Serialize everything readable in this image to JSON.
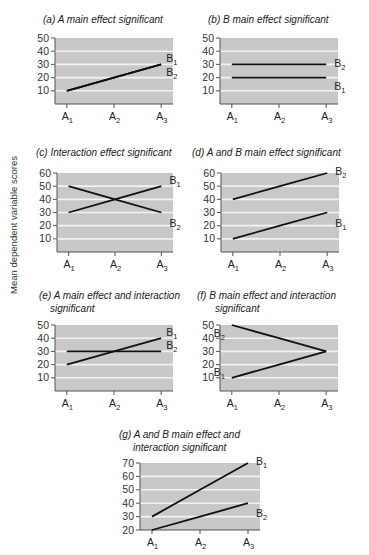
{
  "figure": {
    "shared_ylabel": "Mean dependent variable scores"
  },
  "chart_data": [
    {
      "id": "a",
      "type": "line",
      "title": "(a) A main effect significant",
      "xlabel": "",
      "ylabel": "Mean dependent variable scores",
      "categories": [
        "A1",
        "A2",
        "A3"
      ],
      "yticks": [
        10,
        20,
        30,
        40,
        50
      ],
      "ylim": [
        0,
        50
      ],
      "grid": true,
      "series": [
        {
          "name": "B1",
          "values": [
            10,
            20,
            30
          ]
        },
        {
          "name": "B2",
          "values": [
            10,
            20,
            30
          ]
        }
      ],
      "annotations": [
        "B1 and B2 lines coincide"
      ]
    },
    {
      "id": "b",
      "type": "line",
      "title": "(b) B main effect significant",
      "xlabel": "",
      "ylabel": "Mean dependent variable scores",
      "categories": [
        "A1",
        "A2",
        "A3"
      ],
      "yticks": [
        10,
        20,
        30,
        40,
        50
      ],
      "ylim": [
        0,
        50
      ],
      "grid": true,
      "series": [
        {
          "name": "B1",
          "values": [
            20,
            20,
            20
          ]
        },
        {
          "name": "B2",
          "values": [
            30,
            30,
            30
          ]
        }
      ]
    },
    {
      "id": "c",
      "type": "line",
      "title": "(c) Interaction effect significant",
      "xlabel": "",
      "ylabel": "Mean dependent variable scores",
      "categories": [
        "A1",
        "A2",
        "A3"
      ],
      "yticks": [
        10,
        20,
        30,
        40,
        50,
        60
      ],
      "ylim": [
        0,
        60
      ],
      "grid": true,
      "series": [
        {
          "name": "B1",
          "values": [
            30,
            40,
            50
          ]
        },
        {
          "name": "B2",
          "values": [
            50,
            40,
            30
          ]
        }
      ]
    },
    {
      "id": "d",
      "type": "line",
      "title": "(d) A and B main effect significant",
      "xlabel": "",
      "ylabel": "Mean dependent variable scores",
      "categories": [
        "A1",
        "A2",
        "A3"
      ],
      "yticks": [
        10,
        20,
        30,
        40,
        50,
        60
      ],
      "ylim": [
        0,
        60
      ],
      "grid": true,
      "series": [
        {
          "name": "B1",
          "values": [
            10,
            20,
            30
          ]
        },
        {
          "name": "B2",
          "values": [
            40,
            50,
            60
          ]
        }
      ]
    },
    {
      "id": "e",
      "type": "line",
      "title": "(e) A main effect and interaction significant",
      "xlabel": "",
      "ylabel": "Mean dependent variable scores",
      "categories": [
        "A1",
        "A2",
        "A3"
      ],
      "yticks": [
        10,
        20,
        30,
        40,
        50
      ],
      "ylim": [
        0,
        50
      ],
      "grid": true,
      "series": [
        {
          "name": "B1",
          "values": [
            20,
            30,
            40
          ]
        },
        {
          "name": "B2",
          "values": [
            30,
            30,
            30
          ]
        }
      ]
    },
    {
      "id": "f",
      "type": "line",
      "title": "(f) B main effect and interaction significant",
      "xlabel": "",
      "ylabel": "Mean dependent variable scores",
      "categories": [
        "A1",
        "A2",
        "A3"
      ],
      "yticks": [
        10,
        20,
        30,
        40,
        50
      ],
      "ylim": [
        0,
        50
      ],
      "grid": true,
      "series": [
        {
          "name": "B1",
          "values": [
            10,
            20,
            30
          ]
        },
        {
          "name": "B2",
          "values": [
            50,
            40,
            30
          ]
        }
      ]
    },
    {
      "id": "g",
      "type": "line",
      "title": "(g) A and B main effect and interaction significant",
      "xlabel": "",
      "ylabel": "Mean dependent variable scores",
      "categories": [
        "A1",
        "A2",
        "A3"
      ],
      "yticks": [
        20,
        30,
        40,
        50,
        60,
        70
      ],
      "ylim": [
        20,
        70
      ],
      "grid": true,
      "series": [
        {
          "name": "B1",
          "values": [
            30,
            50,
            70
          ]
        },
        {
          "name": "B2",
          "values": [
            20,
            30,
            40
          ]
        }
      ]
    }
  ],
  "titles": {
    "a": [
      "(a) A main effect significant"
    ],
    "b": [
      "(b) B main effect significant"
    ],
    "c": [
      "(c) Interaction effect significant"
    ],
    "d": [
      "(d) A and B main effect significant"
    ],
    "e": [
      "(e) A main effect and interaction",
      "significant"
    ],
    "f": [
      "(f) B main effect and interaction",
      "significant"
    ],
    "g": [
      "(g) A and B main effect and",
      "interaction significant"
    ]
  },
  "colors": {
    "plot_bg": "#c8c8c8",
    "gridline": "#f2f2f2",
    "line": "#111111",
    "axis": "#555555"
  }
}
